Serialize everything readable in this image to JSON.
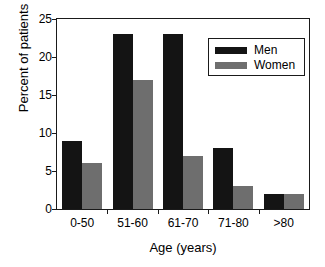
{
  "chart_data": {
    "type": "bar",
    "title": "",
    "xlabel": "Age (years)",
    "ylabel": "Percent of patients",
    "categories": [
      "0-50",
      "51-60",
      "61-70",
      "71-80",
      ">80"
    ],
    "series": [
      {
        "name": "Men",
        "color": "#141414",
        "values": [
          9,
          23,
          23,
          8,
          2
        ]
      },
      {
        "name": "Women",
        "color": "#6e6e6e",
        "values": [
          6,
          17,
          7,
          3,
          2
        ]
      }
    ],
    "ylim": [
      0,
      25
    ],
    "yticks": [
      0,
      5,
      10,
      15,
      20,
      25
    ],
    "ytick_labels": [
      "0",
      "5",
      "10",
      "15",
      "20",
      "25"
    ],
    "grid": false,
    "legend_position": "upper right",
    "legend_entries": [
      "Men",
      "Women"
    ]
  }
}
